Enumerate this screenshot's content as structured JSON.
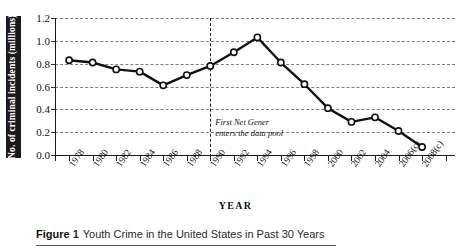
{
  "figure": {
    "label": "Figure",
    "number": "1",
    "caption": "Youth Crime in the United States in Past 30 Years"
  },
  "axis_titles": {
    "x": "YEAR",
    "y": "No. of criminal incidents (millions)"
  },
  "annotation": {
    "line1": "First Net Gener",
    "line2": "enters the data pool",
    "at_year": "1990"
  },
  "colors": {
    "line": "#111111",
    "marker_fill": "#ffffff",
    "marker_stroke": "#111111",
    "grid": "#7d7d7d",
    "axis": "#1a1a1a",
    "ylabel_band_bg": "#1a1a1a",
    "ylabel_band_fg": "#ffffff"
  },
  "chart_data": {
    "type": "line",
    "title": "Youth Crime in the United States in Past 30 Years",
    "xlabel": "YEAR",
    "ylabel": "No. of criminal incidents (millions)",
    "categories": [
      "1978",
      "1980",
      "1982",
      "1984",
      "1986",
      "1988",
      "1990",
      "1992",
      "1994",
      "1996",
      "1998",
      "2000",
      "2002",
      "2004",
      "2006(c)",
      "2008(c)"
    ],
    "values": [
      0.83,
      0.81,
      0.75,
      0.73,
      0.61,
      0.7,
      0.78,
      0.9,
      1.03,
      0.81,
      0.62,
      0.41,
      0.29,
      0.33,
      0.21,
      0.07
    ],
    "ylim": [
      0.0,
      1.2
    ],
    "yticks": [
      "0.0",
      "0.2",
      "0.4",
      "0.6",
      "0.8",
      "1.0",
      "1.2"
    ],
    "ytick_values": [
      0.0,
      0.2,
      0.4,
      0.6,
      0.8,
      1.0,
      1.2
    ],
    "grid": "horizontal-dashed",
    "legend": "none",
    "markers": "open-circle",
    "annotations": [
      {
        "text": "First Net Gener enters the data pool",
        "x": "1990",
        "style": "italic",
        "vertical_dashed_line": true
      }
    ]
  }
}
